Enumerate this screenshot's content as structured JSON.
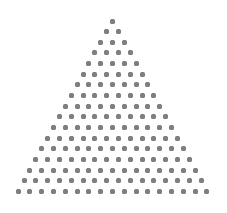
{
  "figure": {
    "type": "triangular-dot-array",
    "rows": 17,
    "dots_per_row": [
      1,
      2,
      3,
      4,
      5,
      6,
      7,
      8,
      9,
      10,
      11,
      12,
      13,
      14,
      15,
      16,
      17
    ],
    "total_dots": 153,
    "dot_color": "#7f7f7f",
    "background": "#ffffff",
    "layout": {
      "apex": {
        "x": 112.5,
        "y": 21
      },
      "row_spacing": 10.65,
      "col_spacing": 11.8,
      "dot_diameter": 5
    }
  }
}
